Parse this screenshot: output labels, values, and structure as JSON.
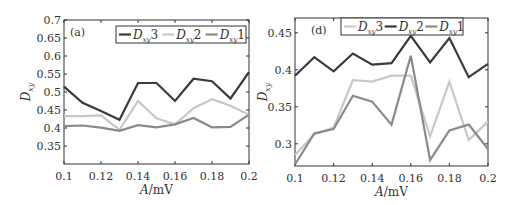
{
  "chart_data": [
    {
      "type": "line",
      "panel": "(a)",
      "xlabel": "A/mV",
      "ylabel": "Dxy",
      "x": [
        0.1,
        0.11,
        0.12,
        0.13,
        0.14,
        0.15,
        0.16,
        0.17,
        0.18,
        0.19,
        0.2
      ],
      "xlim": [
        0.1,
        0.2
      ],
      "ylim": [
        0.3,
        0.7
      ],
      "xticks": [
        "0.1",
        "0.12",
        "0.14",
        "0.16",
        "0.18",
        "0.2"
      ],
      "yticks": [
        "0.35",
        "0.4",
        "0.45",
        "0.5",
        "0.55",
        "0.6",
        "0.65",
        "0.7"
      ],
      "legend_position": "upper right",
      "series": [
        {
          "name": "Dxy3",
          "sub": "xy",
          "base": "D",
          "suffix": "3",
          "color": "#3a3a3a",
          "values": [
            0.515,
            0.47,
            0.447,
            0.423,
            0.525,
            0.525,
            0.475,
            0.537,
            0.53,
            0.482,
            0.555
          ]
        },
        {
          "name": "Dxy2",
          "sub": "xy",
          "base": "D",
          "suffix": "2",
          "color": "#c8c8c8",
          "values": [
            0.433,
            0.433,
            0.435,
            0.395,
            0.475,
            0.427,
            0.41,
            0.455,
            0.48,
            0.462,
            0.437
          ]
        },
        {
          "name": "Dxy1",
          "sub": "xy",
          "base": "D",
          "suffix": "1",
          "color": "#8a8a8a",
          "values": [
            0.405,
            0.407,
            0.401,
            0.392,
            0.408,
            0.402,
            0.41,
            0.428,
            0.402,
            0.403,
            0.437
          ]
        }
      ]
    },
    {
      "type": "line",
      "panel": "(d)",
      "xlabel": "A/mV",
      "ylabel": "Dxy",
      "x": [
        0.1,
        0.11,
        0.12,
        0.13,
        0.14,
        0.15,
        0.16,
        0.17,
        0.18,
        0.19,
        0.2
      ],
      "xlim": [
        0.1,
        0.2
      ],
      "ylim": [
        0.27,
        0.47
      ],
      "xticks": [
        "0.1",
        "0.12",
        "0.14",
        "0.16",
        "0.18",
        "0.2"
      ],
      "yticks": [
        "0.3",
        "0.35",
        "0.4",
        "0.45"
      ],
      "legend_position": "upper center",
      "series": [
        {
          "name": "Dxy3",
          "sub": "xy",
          "base": "D",
          "suffix": "3",
          "color": "#c8c8c8",
          "values": [
            0.285,
            0.313,
            0.322,
            0.386,
            0.384,
            0.392,
            0.392,
            0.31,
            0.384,
            0.305,
            0.33
          ]
        },
        {
          "name": "Dxy2",
          "sub": "xy",
          "base": "D",
          "suffix": "2",
          "color": "#3a3a3a",
          "values": [
            0.392,
            0.417,
            0.398,
            0.422,
            0.407,
            0.409,
            0.446,
            0.41,
            0.443,
            0.39,
            0.408
          ]
        },
        {
          "name": "Dxy1",
          "sub": "xy",
          "base": "D",
          "suffix": "1",
          "color": "#8a8a8a",
          "values": [
            0.272,
            0.314,
            0.32,
            0.365,
            0.357,
            0.326,
            0.419,
            0.278,
            0.318,
            0.326,
            0.293
          ]
        }
      ]
    }
  ]
}
